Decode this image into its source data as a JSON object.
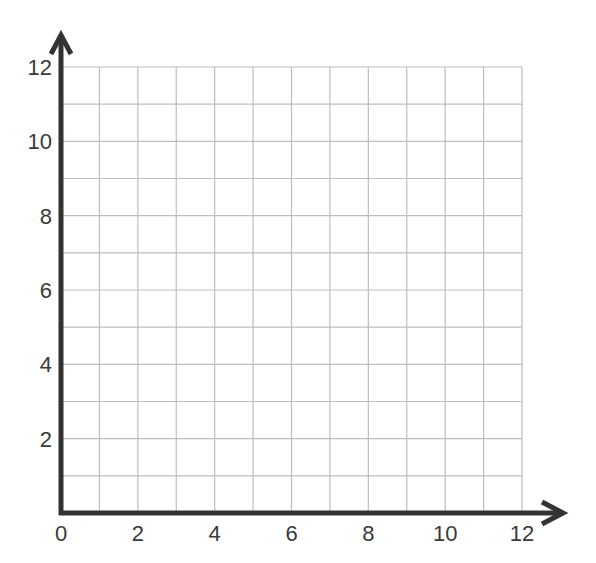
{
  "chart_data": {
    "type": "scatter",
    "title": "",
    "xlabel": "",
    "ylabel": "",
    "xlim": [
      0,
      12
    ],
    "ylim": [
      0,
      12
    ],
    "grid": true,
    "grid_step": 1,
    "x_ticks": [
      "0",
      "2",
      "4",
      "6",
      "8",
      "10",
      "12"
    ],
    "y_ticks": [
      "2",
      "4",
      "6",
      "8",
      "10",
      "12"
    ],
    "series": [],
    "legend": null,
    "axis_arrows": true
  },
  "colors": {
    "axis": "#333333",
    "grid": "#bdbdbd",
    "text": "#3a3a3a",
    "background": "#ffffff"
  }
}
